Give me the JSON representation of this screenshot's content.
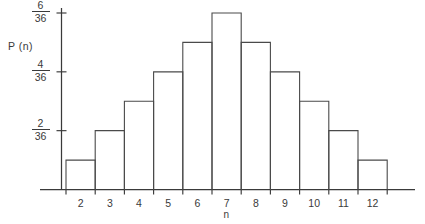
{
  "chart_data": {
    "type": "bar",
    "title": "",
    "subtitle": "",
    "xlabel": "n",
    "ylabel": "P (n)",
    "categories": [
      "2",
      "3",
      "4",
      "5",
      "6",
      "7",
      "8",
      "9",
      "10",
      "11",
      "12"
    ],
    "values": [
      1,
      2,
      3,
      4,
      5,
      6,
      5,
      4,
      3,
      2,
      1
    ],
    "value_unit": "thirty-sixths",
    "values_as_fractions": [
      "1/36",
      "2/36",
      "3/36",
      "4/36",
      "5/36",
      "6/36",
      "5/36",
      "4/36",
      "3/36",
      "2/36",
      "1/36"
    ],
    "ylim": [
      0,
      6
    ],
    "xlim": [
      "1.5",
      "12.5"
    ],
    "grid": false,
    "legend": null,
    "bars_filled": false,
    "y_ticks": [
      {
        "value": 2,
        "numerator": "2",
        "denominator": "36"
      },
      {
        "value": 4,
        "numerator": "4",
        "denominator": "36"
      },
      {
        "value": 6,
        "numerator": "6",
        "denominator": "36"
      }
    ],
    "x_ticks": [
      "2",
      "3",
      "4",
      "5",
      "6",
      "7",
      "8",
      "9",
      "10",
      "11",
      "12"
    ],
    "colors": {
      "axis": "#3a3a3a",
      "bar_stroke": "#4a4a4a",
      "bar_fill": "none",
      "background": "#ffffff",
      "text": "#3a3a3a"
    }
  },
  "axis_labels": {
    "y": "P (n)",
    "x": "n"
  }
}
